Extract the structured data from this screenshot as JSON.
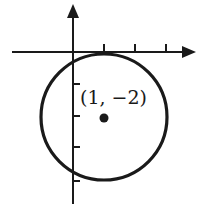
{
  "diagram": {
    "type": "circle-on-coordinate-plane",
    "center_label": "(1, −2)",
    "center": {
      "x": 1,
      "y": -2
    },
    "radius_units": 2,
    "x_ticks": [
      1,
      2,
      3
    ],
    "y_ticks": [
      -1,
      -2,
      -3,
      -4
    ],
    "colors": {
      "stroke": "#1a1a1a",
      "background": "#ffffff"
    }
  }
}
